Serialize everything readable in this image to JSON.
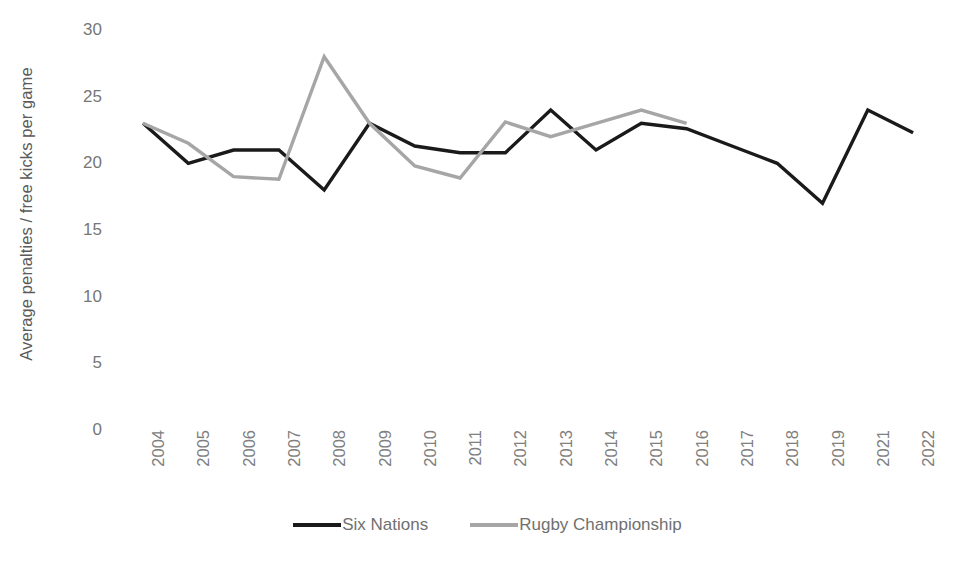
{
  "chart_data": {
    "type": "line",
    "title": "",
    "xlabel": "",
    "ylabel": "Average penalties / free kicks per game",
    "ylim": [
      0,
      30
    ],
    "ytick_labels": [
      "30",
      "25",
      "20",
      "15",
      "10",
      "5",
      "0"
    ],
    "ytick_values": [
      30,
      25,
      20,
      15,
      10,
      5,
      0
    ],
    "grid": false,
    "legend_position": "bottom",
    "categories": [
      "2004",
      "2005",
      "2006",
      "2007",
      "2008",
      "2009",
      "2010",
      "2011",
      "2012",
      "2013",
      "2014",
      "2015",
      "2016",
      "2017",
      "2018",
      "2019",
      "2021",
      "2022"
    ],
    "series": [
      {
        "name": "Six Nations",
        "color": "#1a1a1a",
        "values": [
          23,
          20,
          21,
          21,
          18,
          23,
          21.3,
          20.8,
          20.8,
          24,
          21,
          23,
          22.6,
          21.3,
          20,
          17,
          24,
          22.3
        ]
      },
      {
        "name": "Rugby Championship",
        "color": "#a6a6a6",
        "values": [
          23,
          21.5,
          19,
          18.8,
          28,
          23,
          19.8,
          18.9,
          23.1,
          22,
          23,
          24,
          23,
          null,
          null,
          null,
          null,
          null
        ]
      }
    ]
  },
  "axis": {
    "y_title": "Average penalties / free kicks per game"
  },
  "legend": {
    "items": [
      {
        "label": "Six Nations",
        "color": "#1a1a1a"
      },
      {
        "label": "Rugby Championship",
        "color": "#a6a6a6"
      }
    ]
  }
}
